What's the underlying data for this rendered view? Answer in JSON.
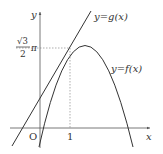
{
  "figure": {
    "type": "function-graph",
    "axes": {
      "x_label": "x",
      "y_label": "y",
      "origin_label": "O"
    },
    "ticks": {
      "x_tick_label": "1",
      "y_tick_label_num": "√3",
      "y_tick_label_den": "2",
      "y_tick_label_suffix": "π"
    },
    "curves": [
      {
        "name": "f",
        "label": "y=f(x)",
        "kind": "parabola-like",
        "x_intercepts": [
          "O",
          "beyond 1"
        ]
      },
      {
        "name": "g",
        "label": "y=g(x)",
        "kind": "line",
        "tangent_at_x": "1"
      }
    ],
    "tangent_point": {
      "x": "1",
      "y": "√3/2 π"
    },
    "colors": {
      "ink": "#333333",
      "dashed": "#666666",
      "background": "#ffffff"
    }
  }
}
